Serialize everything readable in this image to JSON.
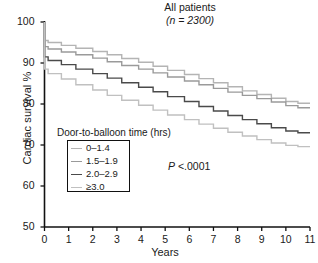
{
  "chart_data": {
    "type": "line",
    "subtype": "kaplan-meier-step",
    "title": "All patients",
    "subtitle": "(n = 2300)",
    "xlabel": "Years",
    "ylabel": "Cardiac survival %",
    "xlim": [
      0,
      11
    ],
    "ylim": [
      50,
      100
    ],
    "xticks": [
      0,
      1,
      2,
      3,
      4,
      5,
      6,
      7,
      8,
      9,
      10,
      11
    ],
    "yticks": [
      50,
      60,
      70,
      80,
      90,
      100
    ],
    "grid": false,
    "legend_position": "inside-lower-left",
    "legend_title": "Door-to-balloon time (hrs)",
    "annotation": "P <.0001",
    "annotation_stat": "P",
    "annotation_value": "<.0001",
    "series": [
      {
        "name": "0–1.4",
        "color": "#b4b4b4",
        "x": [
          0,
          0.15,
          0.7,
          1.3,
          2.0,
          2.6,
          3.2,
          3.9,
          4.5,
          5.1,
          5.8,
          6.4,
          7.0,
          7.6,
          8.2,
          8.8,
          9.4,
          10.0,
          10.5,
          11.0
        ],
        "y": [
          100,
          95.5,
          95.0,
          94.3,
          93.6,
          92.8,
          92.0,
          91.1,
          90.2,
          89.2,
          88.2,
          87.2,
          86.2,
          85.2,
          84.2,
          83.2,
          82.3,
          81.4,
          80.6,
          80.2
        ]
      },
      {
        "name": "1.5–1.9",
        "color": "#9a9a9a",
        "x": [
          0,
          0.15,
          0.7,
          1.3,
          2.0,
          2.6,
          3.2,
          3.9,
          4.5,
          5.1,
          5.8,
          6.4,
          7.0,
          7.6,
          8.2,
          8.8,
          9.4,
          10.0,
          10.5,
          11.0
        ],
        "y": [
          100,
          94.0,
          93.4,
          92.7,
          92.0,
          91.2,
          90.3,
          89.4,
          88.5,
          87.6,
          86.6,
          85.6,
          84.7,
          83.8,
          82.9,
          82.1,
          81.3,
          80.5,
          79.6,
          79.1
        ]
      },
      {
        "name": "2.0–2.9",
        "color": "#4a4a4a",
        "x": [
          0,
          0.15,
          0.7,
          1.3,
          2.0,
          2.6,
          3.2,
          3.9,
          4.5,
          5.1,
          5.8,
          6.4,
          7.0,
          7.6,
          8.2,
          8.8,
          9.4,
          10.0,
          10.5,
          11.0
        ],
        "y": [
          100,
          91.5,
          90.6,
          89.6,
          88.5,
          87.4,
          86.3,
          85.2,
          84.1,
          83.0,
          81.8,
          80.6,
          79.4,
          78.3,
          77.2,
          76.2,
          75.2,
          74.2,
          73.4,
          73.0
        ]
      },
      {
        "name": "≥3.0",
        "color": "#c0c0c0",
        "x": [
          0,
          0.15,
          0.7,
          1.3,
          2.0,
          2.6,
          3.2,
          3.9,
          4.5,
          5.1,
          5.8,
          6.4,
          7.0,
          7.6,
          8.2,
          8.8,
          9.4,
          10.0,
          10.5,
          11.0
        ],
        "y": [
          100,
          88.5,
          87.4,
          86.1,
          84.7,
          83.4,
          82.1,
          80.9,
          79.7,
          78.5,
          77.3,
          76.2,
          75.1,
          74.1,
          73.1,
          72.2,
          71.3,
          70.5,
          69.9,
          69.6
        ]
      }
    ]
  },
  "axes": {
    "color": "#111111"
  }
}
